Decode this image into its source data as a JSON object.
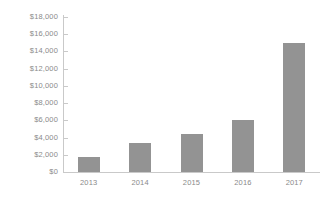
{
  "chart_data": {
    "type": "bar",
    "title": "",
    "subtitle": "",
    "xlabel": "",
    "ylabel": "",
    "categories": [
      "2013",
      "2014",
      "2015",
      "2016",
      "2017"
    ],
    "values": [
      1750,
      3400,
      4400,
      6050,
      15000
    ],
    "series": [
      {
        "name": "",
        "values": [
          1750,
          3400,
          4400,
          6050,
          15000
        ]
      }
    ],
    "ylim": [
      0,
      18000
    ],
    "ytick_values": [
      0,
      2000,
      4000,
      6000,
      8000,
      10000,
      12000,
      14000,
      16000,
      18000
    ],
    "ytick_labels": [
      "$0",
      "$2,000",
      "$4,000",
      "$6,000",
      "$8,000",
      "$10,000",
      "$12,000",
      "$14,000",
      "$16,000",
      "$18,000"
    ],
    "xtick_labels": [
      "2013",
      "2014",
      "2015",
      "2016",
      "2017"
    ],
    "grid": false,
    "legend": false,
    "legend_position": "none",
    "annotations": [],
    "colors": {
      "bar_fill": "#939393",
      "axis_line": "#c9c9c9",
      "tick_label": "#8a8a8a",
      "background": "#ffffff"
    }
  }
}
